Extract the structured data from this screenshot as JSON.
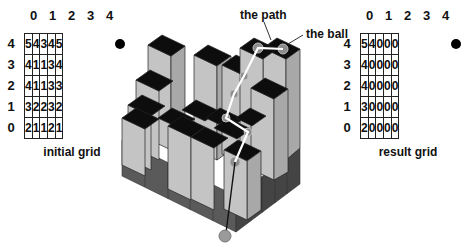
{
  "initial_grid": {
    "caption": "initial grid",
    "col_labels": [
      "0",
      "1",
      "2",
      "3",
      "4"
    ],
    "row_labels": [
      "4",
      "3",
      "2",
      "1",
      "0"
    ],
    "rows": [
      [
        "5",
        "4",
        "3",
        "4",
        "5"
      ],
      [
        "4",
        "1",
        "1",
        "3",
        "4"
      ],
      [
        "4",
        "1",
        "1",
        "3",
        "3"
      ],
      [
        "3",
        "2",
        "2",
        "3",
        "2"
      ],
      [
        "2",
        "1",
        "1",
        "2",
        "1"
      ]
    ],
    "ball_marker": {
      "row": "4",
      "col": "4"
    }
  },
  "result_grid": {
    "caption": "result grid",
    "col_labels": [
      "0",
      "1",
      "2",
      "3",
      "4"
    ],
    "row_labels": [
      "4",
      "3",
      "2",
      "1",
      "0"
    ],
    "rows": [
      [
        "5",
        "4",
        "0",
        "0",
        "0"
      ],
      [
        "4",
        "0",
        "0",
        "0",
        "0"
      ],
      [
        "4",
        "0",
        "0",
        "0",
        "0"
      ],
      [
        "3",
        "0",
        "0",
        "0",
        "0"
      ],
      [
        "2",
        "0",
        "0",
        "0",
        "0"
      ]
    ],
    "ball_marker": {
      "row": "4",
      "col": "4"
    }
  },
  "diagram": {
    "path_label": "the path",
    "ball_label": "the ball",
    "colors": {
      "top": "#0d0d0d",
      "side_light": "#c8c8c8",
      "side_mid": "#a8a8a8",
      "base_dark": "#555555",
      "path": "#ffffff",
      "ball": "#9a9a9a"
    }
  }
}
